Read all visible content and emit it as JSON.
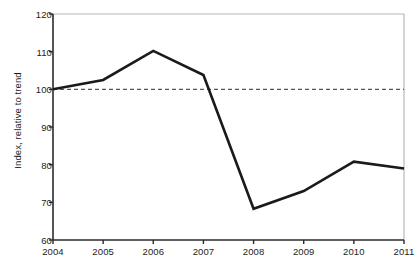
{
  "chart_data": {
    "type": "line",
    "title": "",
    "subtitle": "",
    "xlabel": "",
    "ylabel": "Index, relative to trend",
    "categories": [
      "2004",
      "2005",
      "2006",
      "2007",
      "2008",
      "2009",
      "2010",
      "2011"
    ],
    "x": [
      2004,
      2005,
      2006,
      2007,
      2008,
      2009,
      2010,
      2011
    ],
    "values": [
      100,
      102.5,
      110.2,
      103.8,
      68.3,
      73.0,
      80.8,
      79.0
    ],
    "series": [
      {
        "name": "Index, relative to trend",
        "values": [
          100,
          102.5,
          110.2,
          103.8,
          68.3,
          73.0,
          80.8,
          79.0
        ],
        "color": "#1a1a1a"
      }
    ],
    "reference_line": {
      "name": "trend-baseline",
      "value": 100,
      "style": "dashed",
      "color": "#555555"
    },
    "ylim": [
      60,
      120
    ],
    "yticks": [
      60,
      70,
      80,
      90,
      100,
      110,
      120
    ],
    "ytick_labels": [
      "60",
      "70",
      "80",
      "90",
      "100",
      "110",
      "120"
    ],
    "xlim": [
      2004,
      2011
    ],
    "xticks": [
      2004,
      2005,
      2006,
      2007,
      2008,
      2009,
      2010,
      2011
    ],
    "xtick_labels": [
      "2004",
      "2005",
      "2006",
      "2007",
      "2008",
      "2009",
      "2010",
      "2011"
    ],
    "grid": false,
    "legend": null,
    "legend_position": "none",
    "annotations": []
  },
  "style": {
    "line_color": "#1a1a1a",
    "reference_color": "#555555",
    "axis_color": "#2b2b2b",
    "frame_color": "#b8b8b8",
    "text_color": "#1c1c1c",
    "background": "#ffffff"
  }
}
